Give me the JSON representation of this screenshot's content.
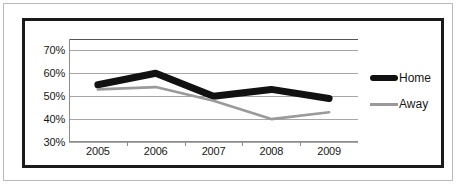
{
  "chart_data": {
    "type": "line",
    "title": "",
    "subtitle": "",
    "xlabel": "",
    "ylabel": "",
    "categories": [
      "2005",
      "2006",
      "2007",
      "2008",
      "2009"
    ],
    "series": [
      {
        "name": "Home",
        "color": "#111111",
        "values": [
          55,
          60,
          50,
          53,
          49
        ]
      },
      {
        "name": "Away",
        "color": "#9a9a9a",
        "values": [
          53,
          54,
          48,
          40,
          43
        ]
      }
    ],
    "ylim": [
      30,
      75
    ],
    "ytick_values": [
      30,
      40,
      50,
      60,
      70
    ],
    "ytick_labels": [
      "30%",
      "40%",
      "50%",
      "60%",
      "70%"
    ],
    "grid": true,
    "grid_axis": "y",
    "legend_position": "right",
    "value_suffix": "%"
  },
  "legend": {
    "entries": [
      {
        "label": "Home",
        "swatch": "home-line-swatch"
      },
      {
        "label": "Away",
        "swatch": "away-line-swatch"
      }
    ]
  },
  "colors": {
    "home": "#111111",
    "away": "#9a9a9a",
    "gridline": "#a6a6a6",
    "axis": "#8c8c8c",
    "chart_border": "#1a1a1a",
    "page_border": "#b9b9b9",
    "text": "#171717",
    "background": "#ffffff"
  }
}
